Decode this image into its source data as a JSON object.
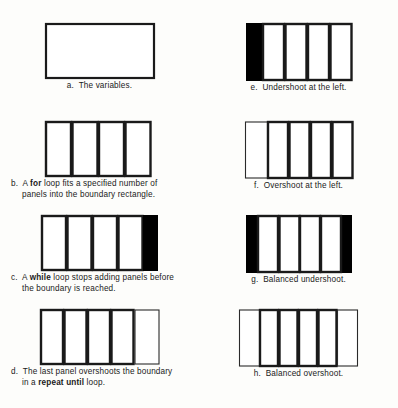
{
  "figure": {
    "colors": {
      "ink": "#000000",
      "paper": "#fdfdfb",
      "fill_black": "#000000",
      "fill_white": "#ffffff"
    },
    "panels": [
      {
        "key": "a",
        "label": "a.",
        "caption_lines": [
          "a.  The variables."
        ],
        "caption_style": "center",
        "art": {
          "type": "empty-rectangle",
          "stroke": "thick",
          "panel_count": 0,
          "black_block": "none",
          "thin_overshoot": "none",
          "width": 110,
          "height": 54
        }
      },
      {
        "key": "b",
        "label": "b.",
        "caption_lines": [
          "b.  A |for| loop fits a specified number of",
          "panels into the boundary rectangle."
        ],
        "caption_style": "hang",
        "art": {
          "type": "paneled-rectangle",
          "stroke": "thick",
          "panel_count": 4,
          "black_block": "none",
          "thin_overshoot": "none",
          "width": 110,
          "height": 54
        }
      },
      {
        "key": "c",
        "label": "c.",
        "caption_lines": [
          "c.  A |while| loop stops adding panels before",
          "the boundary is reached."
        ],
        "caption_style": "hang",
        "art": {
          "type": "paneled-rectangle",
          "stroke": "thick",
          "panel_count": 4,
          "black_block": "right",
          "thin_overshoot": "none",
          "width": 110,
          "height": 54
        }
      },
      {
        "key": "d",
        "label": "d.",
        "caption_lines": [
          "d.  The last panel overshoots the boundary",
          "in a |repeat until| loop."
        ],
        "caption_style": "hang",
        "art": {
          "type": "paneled-rectangle",
          "stroke": "thick",
          "panel_count": 5,
          "black_block": "none",
          "thin_overshoot": "right",
          "width": 110,
          "height": 54
        }
      },
      {
        "key": "e",
        "label": "e.",
        "caption_lines": [
          "e.  Undershoot at the left."
        ],
        "caption_style": "center",
        "art": {
          "type": "paneled-rectangle",
          "stroke": "thick",
          "panel_count": 4,
          "black_block": "left",
          "thin_overshoot": "none",
          "width": 104,
          "height": 57
        }
      },
      {
        "key": "f",
        "label": "f.",
        "caption_lines": [
          "f.  Overshoot at the left."
        ],
        "caption_style": "center",
        "art": {
          "type": "paneled-rectangle",
          "stroke": "thick",
          "panel_count": 5,
          "black_block": "none",
          "thin_overshoot": "left",
          "width": 104,
          "height": 57
        }
      },
      {
        "key": "g",
        "label": "g.",
        "caption_lines": [
          "g.  Balanced undershoot."
        ],
        "caption_style": "center",
        "art": {
          "type": "paneled-rectangle",
          "stroke": "thick",
          "panel_count": 4,
          "black_block": "both",
          "thin_overshoot": "none",
          "width": 104,
          "height": 57
        }
      },
      {
        "key": "h",
        "label": "h.",
        "caption_lines": [
          "h.  Balanced overshoot."
        ],
        "caption_style": "center",
        "art": {
          "type": "paneled-rectangle",
          "stroke": "thick",
          "panel_count": 6,
          "black_block": "none",
          "thin_overshoot": "both",
          "width": 110,
          "height": 57
        }
      }
    ]
  }
}
